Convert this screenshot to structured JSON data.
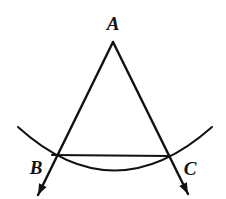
{
  "figure": {
    "kind": "geometry-construction-diagram",
    "background_color": "#ffffff",
    "stroke_color": "#111111",
    "canvas": {
      "width": 226,
      "height": 199
    },
    "labels": {
      "apex": {
        "text": "A",
        "x": 113,
        "y": 30
      },
      "left_base": {
        "text": "B",
        "x": 36,
        "y": 174
      },
      "right_base": {
        "text": "C",
        "x": 190,
        "y": 175
      }
    },
    "points": {
      "A": {
        "x": 113,
        "y": 42
      },
      "B": {
        "x": 52,
        "y": 155
      },
      "C": {
        "x": 170,
        "y": 156
      },
      "left_arrow_tip": {
        "x": 38,
        "y": 195
      },
      "right_arrow_tip": {
        "x": 188,
        "y": 194
      },
      "arc_start": {
        "x": 18,
        "y": 127
      },
      "arc_end": {
        "x": 212,
        "y": 127
      },
      "arc_control": {
        "x": 114,
        "y": 214
      }
    },
    "paths": {
      "ray_ab": "M 113 42 L 38 195",
      "ray_ac": "M 113 42 L 188 194",
      "segment_bc": "M 52 155 L 170 156",
      "arc_bc": "M 18 127 Q 114 214 212 127"
    },
    "arrow_marker": {
      "length": 11,
      "half_width": 4.2
    },
    "stroke_widths": {
      "ray": 2.4,
      "segment": 2.2,
      "arc": 2.0
    }
  }
}
